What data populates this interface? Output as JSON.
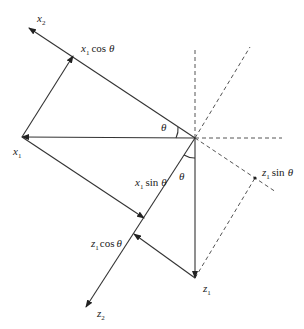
{
  "diagram": {
    "type": "vector-rotation-projection",
    "axes": [
      {
        "id": "x2",
        "label": "x",
        "subscript": "2"
      },
      {
        "id": "z2",
        "label": "z",
        "subscript": "2"
      }
    ],
    "points": [
      {
        "id": "x1",
        "label": "x",
        "subscript": "1"
      },
      {
        "id": "z1",
        "label": "z",
        "subscript": "1"
      }
    ],
    "projections": [
      {
        "id": "x1cos",
        "var": "x",
        "subscript": "1",
        "func": "cos",
        "angle": "θ"
      },
      {
        "id": "x1sin",
        "var": "x",
        "subscript": "1",
        "func": "sin",
        "angle": "θ"
      },
      {
        "id": "z1cos",
        "var": "z",
        "subscript": "1",
        "func": "cos",
        "angle": "θ"
      },
      {
        "id": "z1sin",
        "var": "z",
        "subscript": "1",
        "func": "sin",
        "angle": "θ"
      }
    ],
    "angle_labels": [
      "θ",
      "θ"
    ],
    "colors": {
      "line": "#333333",
      "dashed": "#555555",
      "text": "#222222",
      "background": "#ffffff"
    }
  }
}
